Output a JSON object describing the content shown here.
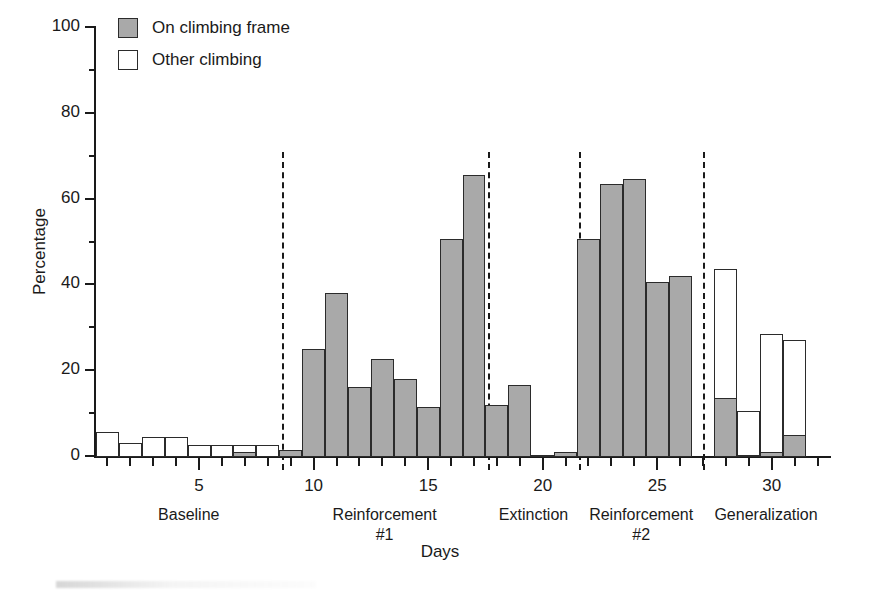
{
  "chart_data": {
    "type": "bar",
    "title": "",
    "xlabel": "Days",
    "ylabel": "Percentage",
    "ylim": [
      0,
      100
    ],
    "yticks": [
      0,
      20,
      40,
      60,
      80,
      100
    ],
    "yticks_minor": [
      10,
      30,
      50,
      70,
      90
    ],
    "xlim": [
      0.5,
      32.5
    ],
    "xticks": [
      5,
      10,
      15,
      20,
      25,
      30
    ],
    "grid": false,
    "legend_position": "top-left",
    "legend": [
      {
        "label": "On climbing frame",
        "fill": "gray"
      },
      {
        "label": "Other climbing",
        "fill": "white"
      }
    ],
    "stacked": true,
    "series": [
      {
        "name": "On climbing frame",
        "fill": "gray",
        "values": [
          0,
          0,
          0,
          0,
          0,
          0,
          1,
          0,
          1.5,
          25,
          38,
          16,
          22.5,
          18,
          11.5,
          50.5,
          65.5,
          12,
          16.5,
          0.3,
          1,
          50.5,
          63.5,
          64.5,
          40.5,
          42,
          13.5,
          0.3,
          1,
          5
        ]
      },
      {
        "name": "Other climbing",
        "fill": "white",
        "values": [
          5.5,
          3,
          4.5,
          4.5,
          2.5,
          2.5,
          1.5,
          2.5,
          0,
          0,
          0,
          0,
          0,
          0,
          0,
          0,
          0,
          0,
          0,
          0,
          0,
          0,
          0,
          0,
          0,
          0,
          30,
          10.2,
          27.5,
          22
        ]
      }
    ],
    "x": [
      1,
      2,
      3,
      4,
      5,
      6,
      7,
      8,
      9,
      10,
      11,
      12,
      13,
      14,
      15,
      16,
      17,
      18,
      19,
      20,
      21,
      22,
      23,
      24,
      25,
      26,
      28,
      29,
      30,
      31
    ],
    "phases": [
      {
        "label": "Baseline",
        "start": 0.5,
        "end": 8.6
      },
      {
        "label": "Reinforcement\n#1",
        "start": 8.6,
        "end": 17.6
      },
      {
        "label": "Extinction",
        "start": 17.6,
        "end": 21.6
      },
      {
        "label": "Reinforcement\n#2",
        "start": 21.6,
        "end": 27.0
      },
      {
        "label": "Generalization",
        "start": 27.0,
        "end": 32.5
      }
    ]
  },
  "colors": {
    "gray_fill": "#a9a9a9",
    "white_fill": "#ffffff",
    "outline": "#2b2b2b",
    "axis": "#1a1a1a",
    "background": "#ffffff"
  }
}
